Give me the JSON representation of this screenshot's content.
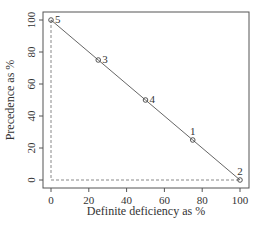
{
  "chart_data": {
    "type": "line",
    "title": "",
    "xlabel": "Definite deficiency as %",
    "ylabel": "Precedence as %",
    "xlim": [
      0,
      100
    ],
    "ylim": [
      0,
      100
    ],
    "xticks": [
      "0",
      "20",
      "40",
      "60",
      "80",
      "100"
    ],
    "yticks": [
      "0",
      "20",
      "40",
      "60",
      "80",
      "100"
    ],
    "grid": false,
    "legend": null,
    "points": [
      {
        "label": "5",
        "x": 0,
        "y": 100
      },
      {
        "label": "3",
        "x": 25,
        "y": 75
      },
      {
        "label": "4",
        "x": 50,
        "y": 50
      },
      {
        "label": "1",
        "x": 75,
        "y": 25
      },
      {
        "label": "2",
        "x": 100,
        "y": 0
      }
    ],
    "reference_lines": [
      {
        "style": "dashed",
        "from": [
          0,
          100
        ],
        "to": [
          0,
          0
        ]
      },
      {
        "style": "dashed",
        "from": [
          0,
          0
        ],
        "to": [
          100,
          0
        ]
      }
    ],
    "colors": {
      "line": "#666666",
      "frame": "#555555",
      "dashed": "#888888"
    }
  }
}
